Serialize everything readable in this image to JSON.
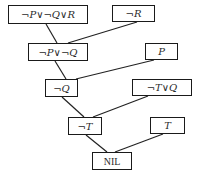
{
  "diagram": {
    "type": "resolution-refutation-tree",
    "nodes": [
      {
        "id": "n1",
        "label": "¬P∨¬Q∨R",
        "x": 8,
        "y": 5,
        "w": 80,
        "h": 19
      },
      {
        "id": "n2",
        "label": "¬R",
        "x": 112,
        "y": 5,
        "w": 43,
        "h": 17
      },
      {
        "id": "n3",
        "label": "¬P∨¬Q",
        "x": 28,
        "y": 43,
        "w": 60,
        "h": 18
      },
      {
        "id": "n4",
        "label": "P",
        "x": 145,
        "y": 43,
        "w": 33,
        "h": 17
      },
      {
        "id": "n5",
        "label": "¬Q",
        "x": 45,
        "y": 79,
        "w": 33,
        "h": 18
      },
      {
        "id": "n6",
        "label": "¬T∨Q",
        "x": 132,
        "y": 79,
        "w": 60,
        "h": 17
      },
      {
        "id": "n7",
        "label": "¬T",
        "x": 68,
        "y": 117,
        "w": 34,
        "h": 18
      },
      {
        "id": "n8",
        "label": "T",
        "x": 150,
        "y": 117,
        "w": 35,
        "h": 17
      },
      {
        "id": "n9",
        "label": "NIL",
        "x": 92,
        "y": 152,
        "w": 40,
        "h": 18
      }
    ],
    "edges": [
      {
        "from": "n1",
        "to": "n3",
        "x1": 46,
        "y1": 24,
        "x2": 57,
        "y2": 43
      },
      {
        "from": "n2",
        "to": "n3",
        "x1": 137,
        "y1": 22,
        "x2": 68,
        "y2": 43
      },
      {
        "from": "n3",
        "to": "n5",
        "x1": 55,
        "y1": 61,
        "x2": 66,
        "y2": 79
      },
      {
        "from": "n4",
        "to": "n5",
        "x1": 154,
        "y1": 60,
        "x2": 76,
        "y2": 79
      },
      {
        "from": "n5",
        "to": "n7",
        "x1": 62,
        "y1": 97,
        "x2": 84,
        "y2": 117
      },
      {
        "from": "n6",
        "to": "n7",
        "x1": 148,
        "y1": 96,
        "x2": 93,
        "y2": 117
      },
      {
        "from": "n7",
        "to": "n9",
        "x1": 86,
        "y1": 135,
        "x2": 107,
        "y2": 152
      },
      {
        "from": "n8",
        "to": "n9",
        "x1": 163,
        "y1": 134,
        "x2": 115,
        "y2": 152
      }
    ]
  }
}
